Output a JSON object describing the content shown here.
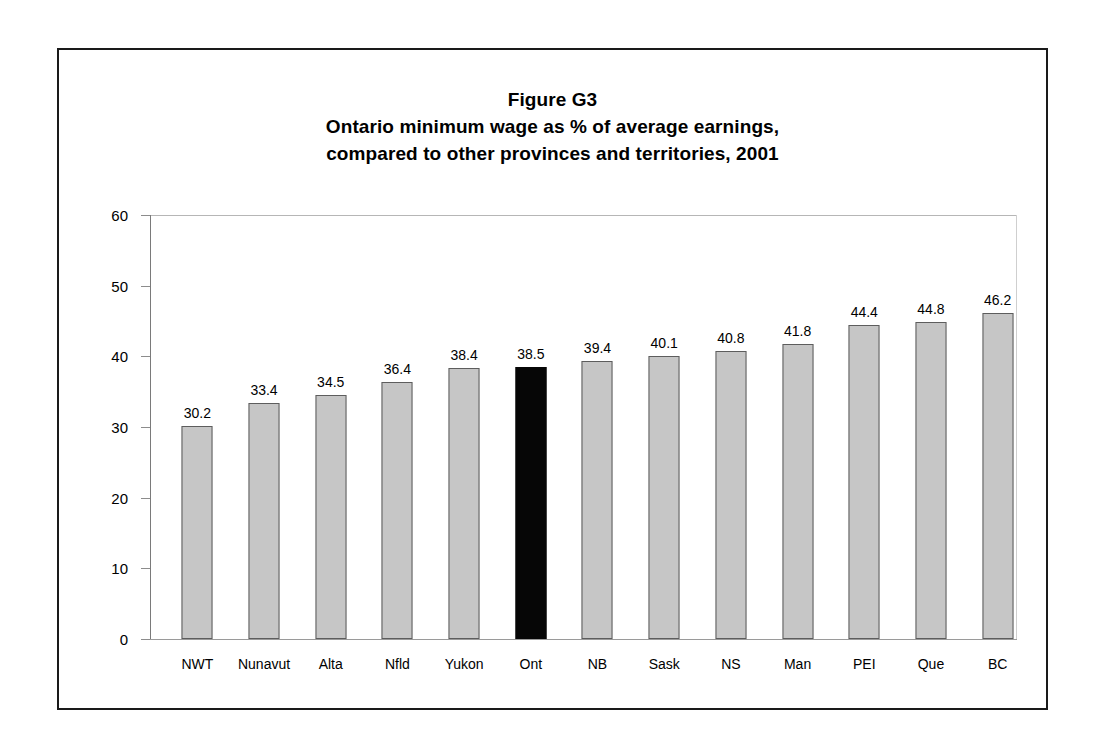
{
  "figure": {
    "title_lines": [
      "Figure G3",
      "Ontario minimum wage as % of average earnings,",
      "compared to other provinces and territories, 2001"
    ]
  },
  "chart_data": {
    "type": "bar",
    "xlabel": "",
    "ylabel": "",
    "ylim": [
      0,
      60
    ],
    "yticks": [
      0,
      10,
      20,
      30,
      40,
      50,
      60
    ],
    "grid": false,
    "legend": "none",
    "categories": [
      "NWT",
      "Nunavut",
      "Alta",
      "Nfld",
      "Yukon",
      "Ont",
      "NB",
      "Sask",
      "NS",
      "Man",
      "PEI",
      "Que",
      "BC"
    ],
    "values": [
      30.2,
      33.4,
      34.5,
      36.4,
      38.4,
      38.5,
      39.4,
      40.1,
      40.8,
      41.8,
      44.4,
      44.8,
      46.2
    ],
    "value_labels": [
      "30.2",
      "33.4",
      "34.5",
      "36.4",
      "38.4",
      "38.5",
      "39.4",
      "40.1",
      "40.8",
      "41.8",
      "44.4",
      "44.8",
      "46.2"
    ],
    "highlight_category": "Ont",
    "colors": {
      "bar_fill": "#c6c6c6",
      "bar_border": "#5d5d5d",
      "highlight_fill": "#060606",
      "axis": "#8c8c8c",
      "text": "#000000",
      "frame": "#1a1a1a"
    }
  }
}
